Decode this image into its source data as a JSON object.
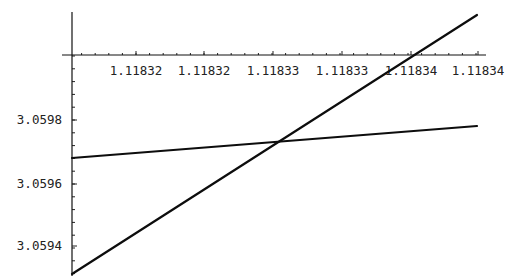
{
  "chart_data": {
    "type": "line",
    "title": "",
    "xlabel": "",
    "ylabel": "",
    "grid": false,
    "legend": null,
    "x_axis": {
      "tick_labels": [
        "1.11832",
        "1.11832",
        "1.11833",
        "1.11833",
        "1.11834",
        "1.11834"
      ],
      "crosses_y_at": 3.06
    },
    "y_axis": {
      "tick_labels": [
        "3.0598",
        "3.0596",
        "3.0594"
      ],
      "ylim": [
        3.0593,
        3.06018
      ]
    },
    "series": [
      {
        "name": "steep line",
        "x": [
          1.118315,
          1.118345
        ],
        "y": [
          3.0593,
          3.06013
        ]
      },
      {
        "name": "shallow line",
        "x": [
          1.118315,
          1.118345
        ],
        "y": [
          3.05967,
          3.05978
        ]
      }
    ],
    "intersection": {
      "x": 1.118331,
      "y": 3.05973
    }
  },
  "render": {
    "x_ticks": [
      {
        "label": "1.11832",
        "px": 136
      },
      {
        "label": "1.11832",
        "px": 204
      },
      {
        "label": "1.11833",
        "px": 273
      },
      {
        "label": "1.11833",
        "px": 342
      },
      {
        "label": "1.11834",
        "px": 411
      },
      {
        "label": "1.11834",
        "px": 478
      }
    ],
    "y_ticks": [
      {
        "label": "3.0598",
        "py": 120
      },
      {
        "label": "3.0596",
        "py": 184
      },
      {
        "label": "3.0594",
        "py": 246
      }
    ],
    "lines": [
      {
        "x1": 72,
        "y1": 274,
        "x2": 477,
        "y2": 15
      },
      {
        "x1": 72,
        "y1": 158,
        "x2": 477,
        "y2": 126
      }
    ]
  }
}
